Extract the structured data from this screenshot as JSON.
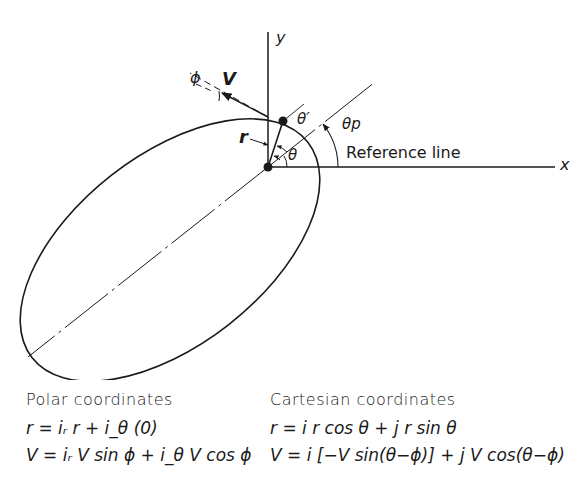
{
  "diagram": {
    "labels": {
      "y_axis": "y",
      "x_axis": "x",
      "velocity": "V",
      "flight_path_angle": "ϕ",
      "radius": "r",
      "true_anomaly": "θ",
      "theta_prime": "θ′",
      "periapsis_angle": "θp",
      "reference_line": "Reference line"
    }
  },
  "polar": {
    "title": "Polar coordinates",
    "r_eq": "r = iᵣ r + i_θ (0)",
    "v_eq": "V = iᵣ V sin ϕ + i_θ V cos ϕ"
  },
  "cartesian": {
    "title": "Cartesian coordinates",
    "r_eq": "r = i r cos θ + j r sin θ",
    "v_eq": "V = i [−V sin(θ−ϕ)] + j V cos(θ−ϕ)"
  }
}
